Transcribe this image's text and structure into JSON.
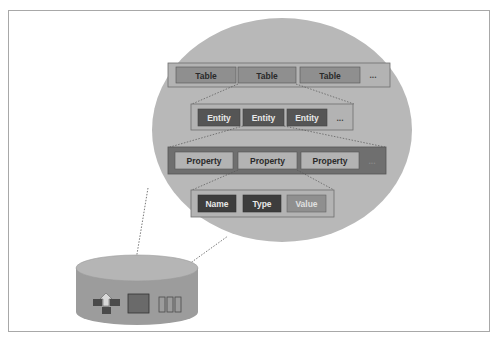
{
  "colors": {
    "frame_border": "#a8a8a8",
    "ellipse_fill": "#b8b8b8",
    "table_row_bg": "#b3b3b3",
    "table_box": "#8f8f8f",
    "entity_row_bg": "#b3b3b3",
    "entity_box": "#555555",
    "property_row_bg": "#6f6f6f",
    "property_box": "#b3b3b3",
    "attr_row_bg": "#b3b3b3",
    "name_box": "#3d3d3d",
    "type_box": "#3d3d3d",
    "value_box": "#8f8f8f",
    "cylinder": "#9c9c9c",
    "cylinder_top": "#b5b5b5"
  },
  "diagram": {
    "tables": {
      "items": [
        "Table",
        "Table",
        "Table"
      ],
      "more": "..."
    },
    "entities": {
      "items": [
        "Entity",
        "Entity",
        "Entity"
      ],
      "more": "..."
    },
    "properties": {
      "items": [
        "Property",
        "Property",
        "Property"
      ],
      "more": "..."
    },
    "attributes": {
      "items": [
        "Name",
        "Type",
        "Value"
      ]
    },
    "storage": {
      "icons": [
        "network-icon",
        "table-storage-icon",
        "queue-icon"
      ]
    }
  }
}
